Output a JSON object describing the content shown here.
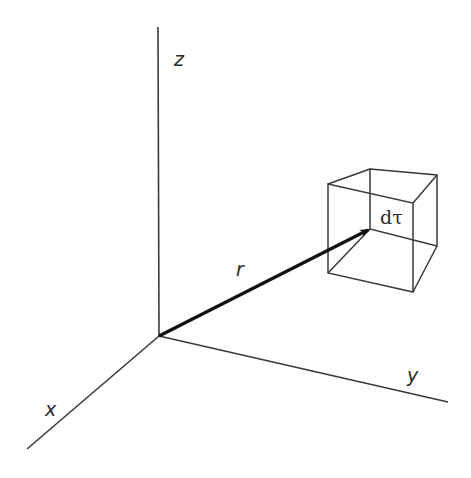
{
  "diagram": {
    "colors": {
      "axis": "#3a3a3a",
      "vector": "#111111",
      "cube": "#3a3a3a",
      "text": "#2a2a2a"
    },
    "axes": {
      "origin": [
        159,
        336
      ],
      "z": {
        "label": "z",
        "end": [
          158,
          27
        ]
      },
      "y": {
        "label": "y",
        "end": [
          448,
          402
        ]
      },
      "x": {
        "label": "x",
        "end": [
          27,
          449
        ]
      }
    },
    "vector": {
      "label": "r",
      "from": [
        159,
        336
      ],
      "to": [
        370,
        229
      ]
    },
    "volume_element": {
      "label": "dτ",
      "front": {
        "tl": [
          328,
          184
        ],
        "tr": [
          413,
          203
        ],
        "br": [
          413,
          292
        ],
        "bl": [
          328,
          273
        ]
      },
      "back": {
        "tl": [
          370,
          169
        ],
        "tr": [
          437,
          175
        ],
        "br": [
          437,
          246
        ],
        "bl": [
          370,
          229
        ]
      }
    }
  }
}
